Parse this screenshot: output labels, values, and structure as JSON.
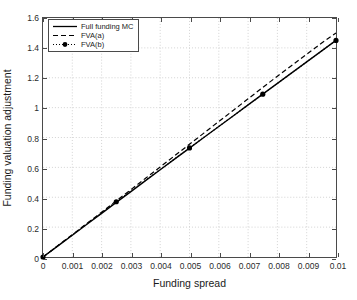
{
  "chart_data": {
    "type": "line",
    "title": "",
    "xlabel": "Funding spread",
    "ylabel": "Funding valuation adjustment",
    "xlim": [
      0,
      0.01
    ],
    "ylim": [
      0,
      1.6
    ],
    "xticks": [
      0,
      0.001,
      0.002,
      0.003,
      0.004,
      0.005,
      0.006,
      0.007,
      0.008,
      0.009,
      0.01
    ],
    "xticklabels": [
      "0",
      "0.001",
      "0.002",
      "0.003",
      "0.004",
      "0.005",
      "0.006",
      "0.007",
      "0.008",
      "0.009",
      "0.01"
    ],
    "yticks": [
      0,
      0.2,
      0.4,
      0.6,
      0.8,
      1,
      1.2,
      1.4,
      1.6
    ],
    "yticklabels": [
      "0",
      "0.2",
      "0.4",
      "0.6",
      "0.8",
      "1",
      "1.2",
      "1.4",
      "1.6"
    ],
    "grid": true,
    "grid_style": "dotted",
    "grid_color": "#c8c8c8",
    "legend_position": "upper left",
    "series": [
      {
        "name": "Full funding MC",
        "style": "solid",
        "color": "#000000",
        "marker": "none",
        "x": [
          0,
          0.0005,
          0.001,
          0.0015,
          0.002,
          0.0025,
          0.003,
          0.0035,
          0.004,
          0.0045,
          0.005,
          0.0055,
          0.006,
          0.0065,
          0.007,
          0.0075,
          0.008,
          0.0085,
          0.009,
          0.0095,
          0.01
        ],
        "y": [
          0,
          0.073,
          0.146,
          0.219,
          0.292,
          0.366,
          0.438,
          0.511,
          0.584,
          0.657,
          0.729,
          0.802,
          0.874,
          0.946,
          1.018,
          1.09,
          1.162,
          1.234,
          1.306,
          1.378,
          1.45
        ]
      },
      {
        "name": "FVA(a)",
        "style": "dashed",
        "color": "#000000",
        "marker": "none",
        "x": [
          0,
          0.0005,
          0.001,
          0.0015,
          0.002,
          0.0025,
          0.003,
          0.0035,
          0.004,
          0.0045,
          0.005,
          0.0055,
          0.006,
          0.0065,
          0.007,
          0.0075,
          0.008,
          0.0085,
          0.009,
          0.0095,
          0.01
        ],
        "y": [
          0,
          0.075,
          0.15,
          0.225,
          0.3,
          0.376,
          0.451,
          0.527,
          0.603,
          0.679,
          0.755,
          0.831,
          0.907,
          0.983,
          1.059,
          1.135,
          1.21,
          1.284,
          1.358,
          1.431,
          1.5
        ]
      },
      {
        "name": "FVA(b)",
        "style": "dotted",
        "color": "#000000",
        "marker": "filled-circle",
        "x": [
          0,
          0.0025,
          0.005,
          0.0075,
          0.01
        ],
        "y": [
          0,
          0.37,
          0.73,
          1.09,
          1.45
        ]
      }
    ]
  },
  "legend": {
    "items": [
      {
        "label": "Full funding MC"
      },
      {
        "label": "FVA(a)"
      },
      {
        "label": "FVA(b)"
      }
    ]
  }
}
